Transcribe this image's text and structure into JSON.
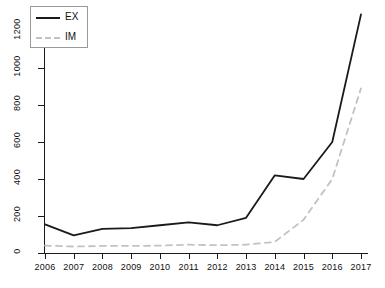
{
  "chart_data": {
    "type": "line",
    "title": "",
    "xlabel": "",
    "ylabel": "",
    "x": [
      2006,
      2007,
      2008,
      2009,
      2010,
      2011,
      2012,
      2013,
      2014,
      2015,
      2016,
      2017
    ],
    "xticklabels": [
      "2006",
      "2007",
      "2008",
      "2009",
      "2010",
      "2011",
      "2012",
      "2013",
      "2014",
      "2015",
      "2016",
      "2017"
    ],
    "yticklabels": [
      "0",
      "200",
      "400",
      "600",
      "800",
      "1000",
      "1200"
    ],
    "yticks": [
      0,
      200,
      400,
      600,
      800,
      1000,
      1200
    ],
    "ylim": [
      0,
      1300
    ],
    "xlim": [
      2006,
      2017
    ],
    "grid": false,
    "legend_position": "top-left",
    "series": [
      {
        "name": "EX",
        "style": "solid",
        "color": "#1a1a1a",
        "values": [
          155,
          95,
          130,
          135,
          150,
          165,
          150,
          190,
          420,
          400,
          600,
          1290
        ]
      },
      {
        "name": "IM",
        "style": "dashed",
        "color": "#c2c2c2",
        "values": [
          40,
          35,
          38,
          38,
          40,
          45,
          42,
          45,
          60,
          180,
          400,
          890
        ]
      }
    ]
  },
  "legend": {
    "items": [
      {
        "label": "EX"
      },
      {
        "label": "IM"
      }
    ]
  },
  "colors": {
    "ex_line": "#1a1a1a",
    "im_line": "#c2c2c2",
    "axis": "#1a1a1a",
    "background": "#ffffff"
  }
}
